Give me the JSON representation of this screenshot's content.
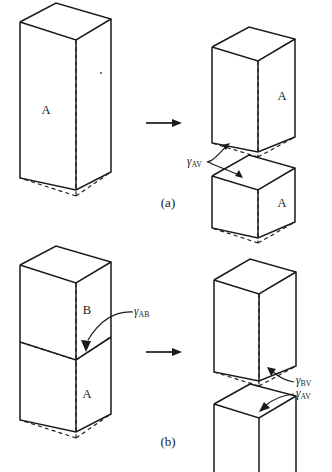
{
  "figure": {
    "title_implicit": "Work of cohesion and work of adhesion schematic",
    "background_color": "#ffffff",
    "line_color": "#1a1a1a",
    "width": 332,
    "height": 472
  },
  "panels": [
    {
      "id": "a",
      "label": "(a)",
      "label_x": 168,
      "label_y": 204,
      "process_arrow": {
        "x1": 146,
        "y1": 123,
        "x2": 182,
        "y2": 123
      },
      "before": {
        "name": "tall-bar-single-phase",
        "face_label": "A",
        "face_label_x": 46,
        "face_label_y": 111
      },
      "after": [
        {
          "name": "upper-half-bar",
          "face_label": "A",
          "face_label_x": 282,
          "face_label_y": 97
        },
        {
          "name": "lower-half-bar",
          "face_label": "A",
          "face_label_x": 282,
          "face_label_y": 204
        }
      ],
      "energy_labels": [
        {
          "symbol": "γ",
          "subscript": "AV",
          "text": "γAV",
          "x": 192,
          "y": 161,
          "points_to": [
            "upper-half-bar-new-surface",
            "lower-half-bar-new-surface"
          ]
        }
      ]
    },
    {
      "id": "b",
      "label": "(b)",
      "label_x": 168,
      "label_y": 443,
      "process_arrow": {
        "x1": 146,
        "y1": 352,
        "x2": 182,
        "y2": 352
      },
      "before": {
        "name": "tall-bar-two-phase",
        "face_labels": [
          {
            "text": "B",
            "x": 87,
            "y": 311
          },
          {
            "text": "A",
            "x": 87,
            "y": 395
          }
        ],
        "interface_name": "ab-interface"
      },
      "after": [
        {
          "name": "upper-bar-phase-b",
          "face_label": ""
        },
        {
          "name": "lower-bar-phase-a",
          "face_label": ""
        }
      ],
      "energy_labels": [
        {
          "symbol": "γ",
          "subscript": "AB",
          "text": "γAB",
          "x": 139,
          "y": 312,
          "points_to": [
            "ab-interface"
          ]
        },
        {
          "symbol": "γ",
          "subscript": "BV",
          "text": "γBV",
          "x": 300,
          "y": 382,
          "points_to": [
            "upper-bar-phase-b-new-surface"
          ]
        },
        {
          "symbol": "γ",
          "subscript": "AV",
          "text": "γAV",
          "x": 300,
          "y": 394,
          "points_to": [
            "lower-bar-phase-a-new-surface"
          ]
        }
      ]
    }
  ],
  "glyphs": {
    "gamma": "γ",
    "arrow_right": "→"
  }
}
